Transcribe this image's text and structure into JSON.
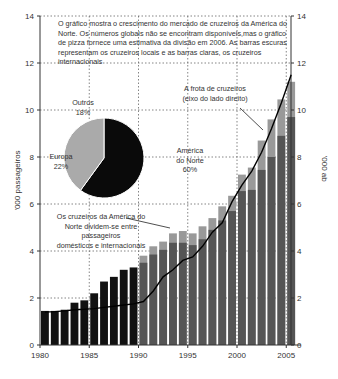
{
  "chart_data": {
    "type": "bar",
    "title": "",
    "xlabel": "",
    "ylabel": "'000 passageiros",
    "ylabel_right": "'000 ab",
    "ylim": [
      0,
      14
    ],
    "y_ticks": [
      0,
      2,
      4,
      6,
      8,
      10,
      12,
      14
    ],
    "x_tick_labels": [
      "1980",
      "1985",
      "1990",
      "1995",
      "2000",
      "2005"
    ],
    "grid": "dotted",
    "categories": [
      "1980",
      "1981",
      "1982",
      "1983",
      "1984",
      "1985",
      "1986",
      "1987",
      "1988",
      "1989",
      "1990",
      "1991",
      "1992",
      "1993",
      "1994",
      "1995",
      "1996",
      "1997",
      "1998",
      "1999",
      "2000",
      "2001",
      "2002",
      "2003",
      "2004",
      "2005"
    ],
    "series": [
      {
        "name": "Cruzeiros locais (barras escuras)",
        "type": "bar",
        "values": [
          1.45,
          1.45,
          1.5,
          1.8,
          1.9,
          2.2,
          2.7,
          2.9,
          3.2,
          3.3,
          3.5,
          3.85,
          4.05,
          4.35,
          4.35,
          4.25,
          4.5,
          4.9,
          5.3,
          5.7,
          6.55,
          6.6,
          7.45,
          8.0,
          8.9,
          9.7
        ]
      },
      {
        "name": "Total incl. cruzeiros internacionais (barras claras)",
        "type": "bar",
        "values": [
          1.45,
          1.45,
          1.5,
          1.8,
          1.9,
          2.2,
          2.7,
          2.9,
          3.2,
          3.3,
          3.8,
          4.2,
          4.4,
          4.75,
          4.85,
          4.75,
          5.05,
          5.4,
          5.9,
          6.35,
          7.25,
          7.55,
          8.7,
          9.6,
          10.45,
          11.2
        ]
      },
      {
        "name": "A frota de cruzeiros (eixo do lado direito)",
        "type": "line",
        "axis": "right",
        "values": [
          1.4,
          1.42,
          1.45,
          1.5,
          1.52,
          1.55,
          1.6,
          1.65,
          1.7,
          1.75,
          1.85,
          2.3,
          2.9,
          3.2,
          3.6,
          3.75,
          4.2,
          4.8,
          5.2,
          6.1,
          6.8,
          7.4,
          8.2,
          9.2,
          10.3,
          11.5
        ]
      }
    ],
    "pie": {
      "slices": [
        {
          "label": "América do Norte",
          "value": 60,
          "color": "#0a0a0a"
        },
        {
          "label": "Europa",
          "value": 22,
          "color": "#aaaaaa"
        },
        {
          "label": "Outros",
          "value": 18,
          "color": "#aaaaaa"
        }
      ]
    },
    "annotations": {
      "intro": [
        "O gráfico mostra o crescimento do mercado de cruzeiros da América do",
        "Norte. Os números globais não se encontram disponíveis,mas o gráfico",
        "de pizza fornece uma estimativa da divisão em 2006. As barras escuras",
        "representam os cruzeiros locais e as barras claras, os cruzeiros internacionais"
      ],
      "fleet": [
        "A frota de cruzeiros",
        "(eixo do lado direito)"
      ],
      "split": [
        "Os cruzeiros da América do",
        "Norte dividem-se entre passageiros",
        "domésticos e internacionais"
      ],
      "pie_labels": {
        "outros": [
          "Outros",
          "18%"
        ],
        "europa": [
          "Europa",
          "22%"
        ],
        "america": [
          "América",
          "do Norte",
          "60%"
        ]
      }
    }
  },
  "colors": {
    "pre1990_bar": "#111111",
    "dark_bar": "#555555",
    "light_bar": "#999999",
    "line": "#000000",
    "grid": "#666666"
  }
}
